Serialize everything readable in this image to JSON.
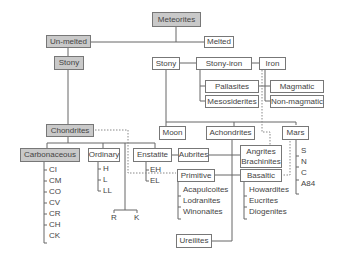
{
  "diagram": {
    "root": "Meteorites",
    "unmelted": "Un-melted",
    "melted": "Melted",
    "stony_left": "Stony",
    "stony_mid": "Stony",
    "stony_iron": "Stony-iron",
    "iron": "Iron",
    "pallasites": "Pallasites",
    "mesosiderites": "Mesosiderites",
    "magmatic": "Magmatic",
    "non_magmatic": "Non-magmatic",
    "chondrites": "Chondrites",
    "carbonaceous": "Carbonaceous",
    "ordinary": "Ordinary",
    "enstatite": "Enstatite",
    "moon": "Moon",
    "achondrites": "Achondrites",
    "mars": "Mars",
    "aubrites": "Aubrites",
    "angrites": "Angrites",
    "brachinites": "Brachinites",
    "primitive": "Primitive",
    "basaltic": "Basaltic",
    "ureilites": "Ureilites",
    "carbonaceous_groups": [
      "CI",
      "CM",
      "CO",
      "CV",
      "CR",
      "CH",
      "CK"
    ],
    "ordinary_groups": [
      "H",
      "L",
      "LL"
    ],
    "enstatite_groups": [
      "EH",
      "EL"
    ],
    "rk_groups": [
      "R",
      "K"
    ],
    "mars_groups": [
      "S",
      "N",
      "C",
      "A84"
    ],
    "primitive_groups": [
      "Acapulcoites",
      "Lodranites",
      "Winonaites"
    ],
    "basaltic_groups": [
      "Howardites",
      "Eucrites",
      "Diogenites"
    ]
  }
}
